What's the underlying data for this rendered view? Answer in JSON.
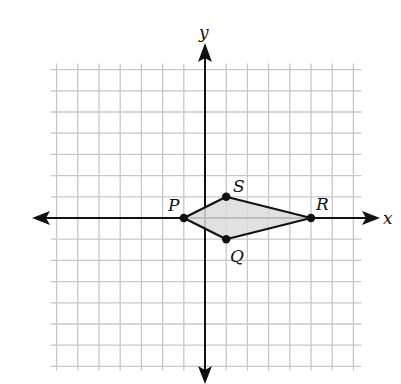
{
  "diagram": {
    "type": "coordinate-plane",
    "grid": {
      "min": -7,
      "max": 7,
      "step": 1,
      "color": "#c8c8c8"
    },
    "axes": {
      "x_label": "x",
      "y_label": "y",
      "color": "#111111"
    },
    "polygon": {
      "name": "PQRS",
      "fill": "#dcdcdc",
      "stroke": "#111111",
      "vertices": [
        {
          "label": "P",
          "x": -1,
          "y": 0
        },
        {
          "label": "Q",
          "x": 1,
          "y": -1
        },
        {
          "label": "R",
          "x": 5,
          "y": 0
        },
        {
          "label": "S",
          "x": 1,
          "y": 1
        }
      ]
    }
  },
  "labels": {
    "x_axis": "x",
    "y_axis": "y",
    "P": "P",
    "Q": "Q",
    "R": "R",
    "S": "S"
  }
}
